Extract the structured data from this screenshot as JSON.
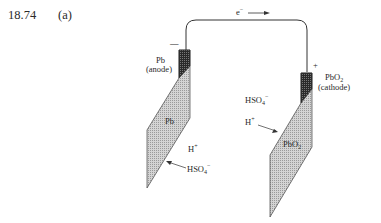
{
  "problem": {
    "number": "18.74",
    "part": "(a)"
  },
  "diagram": {
    "electron_flow": {
      "label": "e",
      "superscript": "−",
      "direction": "left-to-right"
    },
    "anode": {
      "sign": "—",
      "terminal_label": "Pb",
      "role_label": "(anode)",
      "plate_label": "Pb",
      "ions": [
        {
          "base": "H",
          "sup": "+",
          "sub": ""
        },
        {
          "base": "HSO",
          "sup": "−",
          "sub": "4"
        }
      ]
    },
    "cathode": {
      "sign": "+",
      "terminal_label_base": "PbO",
      "terminal_label_sub": "2",
      "role_label": "(cathode)",
      "plate_label_base": "PbO",
      "plate_label_sub": "2",
      "ions": [
        {
          "base": "HSO",
          "sup": "−",
          "sub": "4"
        },
        {
          "base": "H",
          "sup": "+",
          "sub": ""
        }
      ]
    },
    "colors": {
      "plate_fill": "#c8c8c8",
      "terminal_fill": "#3a3a3a",
      "wire": "#333333"
    }
  }
}
